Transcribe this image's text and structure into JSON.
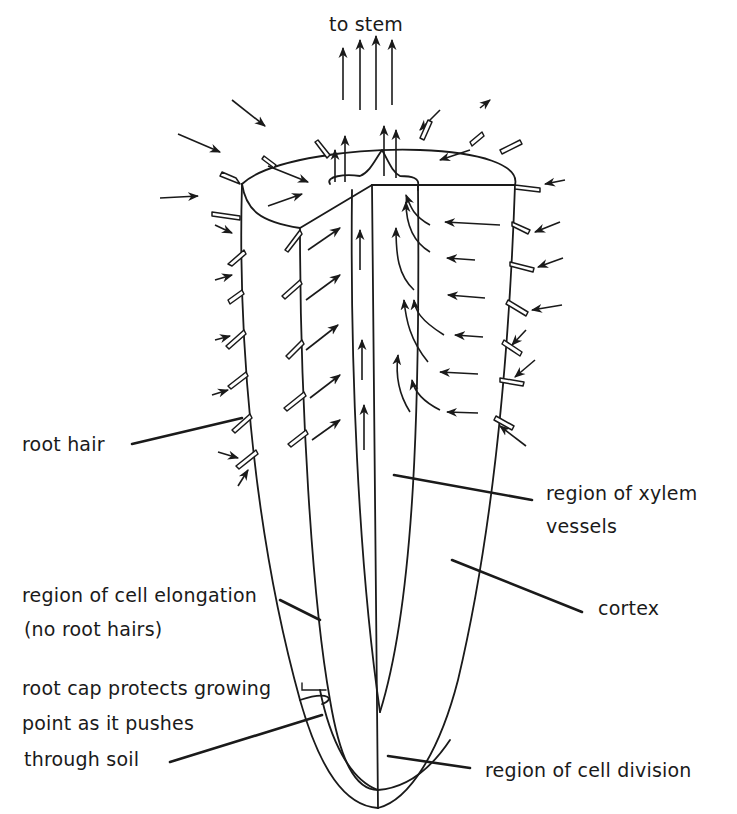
{
  "labels": {
    "to_stem": "to stem",
    "root_hair": "root hair",
    "xylem_line1": "region of xylem",
    "xylem_line2": "vessels",
    "cortex": "cortex",
    "elongation_line1": "region of cell elongation",
    "elongation_line2": "(no root hairs)",
    "rootcap_line1": "root cap protects growing",
    "rootcap_line2": "point as it pushes",
    "rootcap_line3": "through soil",
    "division": "region of cell division"
  },
  "icons": {
    "water_flow_arrows": "arrow-icon",
    "root_hairs": "root-hair-icon"
  },
  "colors": {
    "ink": "#1a1a1a",
    "background": "#ffffff"
  }
}
